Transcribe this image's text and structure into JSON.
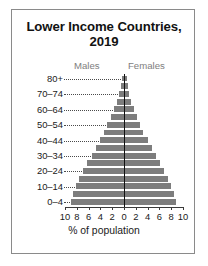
{
  "chart_data": {
    "type": "bar",
    "subtype": "population-pyramid",
    "title": "Lower Income Countries, 2019",
    "title_line1": "Lower Income Countries,",
    "title_line2": "2019",
    "xlabel": "% of population",
    "ylabel": "",
    "xlim": [
      -10,
      10
    ],
    "xticks": [
      10,
      8,
      6,
      4,
      2,
      0,
      2,
      4,
      6,
      8,
      10
    ],
    "xtick_labels": [
      "10",
      "8",
      "6",
      "4",
      "2",
      "0",
      "2",
      "4",
      "6",
      "8",
      "10"
    ],
    "grid": false,
    "legend_position": "top",
    "legend": [
      "Males",
      "Females"
    ],
    "bar_color": "#7d7d7d",
    "categories": [
      "0-4",
      "5-9",
      "10-14",
      "15-19",
      "20-24",
      "25-29",
      "30-34",
      "35-39",
      "40-44",
      "45-49",
      "50-54",
      "55-59",
      "60-64",
      "65-69",
      "70-74",
      "75-79",
      "80+"
    ],
    "visible_category_labels": [
      "0–4",
      "10–14",
      "20–24",
      "30–34",
      "40–44",
      "50–54",
      "60–64",
      "70–74",
      "80+"
    ],
    "series": [
      {
        "name": "Males",
        "values": [
          9.0,
          8.7,
          8.2,
          7.6,
          7.0,
          6.3,
          5.5,
          4.8,
          4.1,
          3.4,
          2.8,
          2.2,
          1.7,
          1.2,
          0.8,
          0.5,
          0.4
        ]
      },
      {
        "name": "Females",
        "values": [
          8.8,
          8.5,
          8.0,
          7.4,
          6.8,
          6.1,
          5.4,
          4.7,
          4.0,
          3.3,
          2.7,
          2.2,
          1.7,
          1.2,
          0.9,
          0.6,
          0.5
        ]
      }
    ]
  },
  "chart": {
    "legend_males": "Males",
    "legend_females": "Females"
  }
}
